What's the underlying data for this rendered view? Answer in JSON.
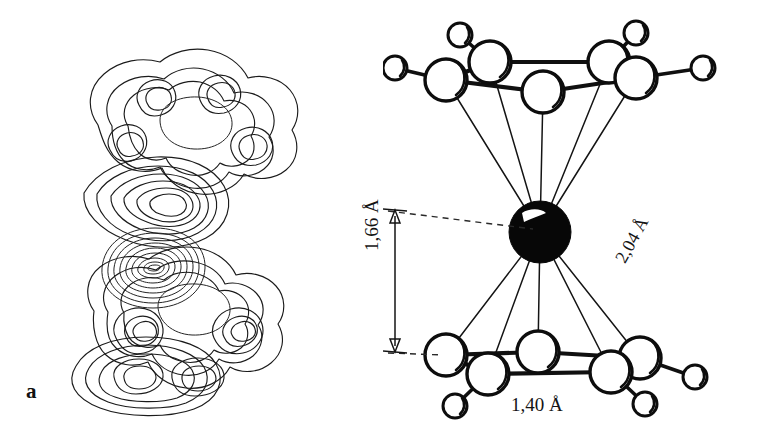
{
  "figure": {
    "background_color": "#ffffff",
    "ink_color": "#101010",
    "width": 766,
    "height": 443
  },
  "panels": [
    {
      "id": "a",
      "label": "a",
      "caption": "electron density contour map of ferrocene",
      "type": "contour-map"
    },
    {
      "id": "b",
      "label": "b",
      "caption": "ball-and-stick model of ferrocene",
      "type": "molecular-model"
    }
  ],
  "dimensions": {
    "metal_to_ring": {
      "value": "1,66",
      "unit": "Å",
      "label": "1,66 Å",
      "orientation": "vertical",
      "description": "Fe to cyclopentadienyl ring plane distance"
    },
    "metal_to_carbon": {
      "value": "2,04",
      "unit": "Å",
      "label": "2,04 Å",
      "orientation": "diagonal",
      "description": "Fe to carbon bond length"
    },
    "carbon_carbon": {
      "value": "1,40",
      "unit": "Å",
      "label": "1,40 Å",
      "orientation": "horizontal",
      "description": "C to C bond length within ring"
    }
  },
  "molecule": {
    "center_atom": {
      "symbol": "Fe",
      "rendering": "filled-black-sphere"
    },
    "ligands": [
      {
        "name": "cyclopentadienyl-ring-top",
        "carbons": 5,
        "hydrogens": 5
      },
      {
        "name": "cyclopentadienyl-ring-bottom",
        "carbons": 5,
        "hydrogens": 5
      }
    ],
    "carbon_rendering": "large-open-circle",
    "hydrogen_rendering": "small-open-circle"
  },
  "contour_map": {
    "type": "contour",
    "description": "Nested closed contour lines showing electron density of the two cyclopentadienyl rings and the central iron atom",
    "line_color": "#1b1b1b",
    "fill": "none",
    "features": [
      {
        "name": "top-ring-density",
        "contour_levels": 4
      },
      {
        "name": "bottom-ring-density",
        "contour_levels": 4
      },
      {
        "name": "iron-core-density",
        "contour_levels": 11
      }
    ]
  }
}
